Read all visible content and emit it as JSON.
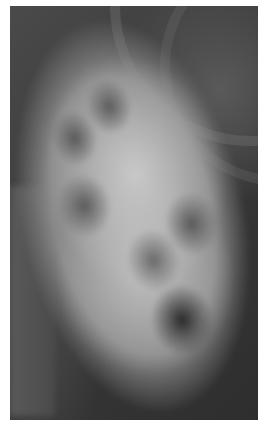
{
  "image": {
    "type": "radiograph",
    "description": "Grayscale X-ray image of a large lobulated soft-tissue mass with a white border",
    "colors": {
      "border": "#ffffff",
      "background_dark": "#3c3c3c",
      "mass_light": "#c8c8c8",
      "lucency_dark": "#2a2a2a"
    }
  }
}
